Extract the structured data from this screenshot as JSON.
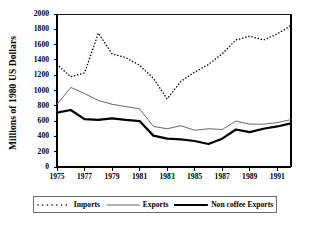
{
  "chart_data": {
    "type": "line",
    "title": "",
    "xlabel": "",
    "ylabel": "Millions of 1980 US Dollars",
    "xlim": [
      1975,
      1992
    ],
    "ylim": [
      0,
      2000
    ],
    "grid": false,
    "legend_position": "bottom",
    "x": [
      1975,
      1976,
      1977,
      1978,
      1979,
      1980,
      1981,
      1982,
      1983,
      1984,
      1985,
      1986,
      1987,
      1988,
      1989,
      1990,
      1991,
      1992
    ],
    "xtick_labels": [
      "1975",
      "1977",
      "1979",
      "1981",
      "1983",
      "1985",
      "1987",
      "1989",
      "1991"
    ],
    "xtick_values": [
      1975,
      1977,
      1979,
      1981,
      1983,
      1985,
      1987,
      1989,
      1991
    ],
    "ytick_labels": [
      "0",
      "200",
      "400",
      "600",
      "800",
      "1000",
      "1200",
      "1400",
      "1600",
      "1800",
      "2000"
    ],
    "ytick_values": [
      0,
      200,
      400,
      600,
      800,
      1000,
      1200,
      1400,
      1600,
      1800,
      2000
    ],
    "series": [
      {
        "name": "Imports",
        "style": "dotted",
        "color": "#000000",
        "values": [
          1340,
          1180,
          1230,
          1750,
          1480,
          1430,
          1330,
          1160,
          890,
          1120,
          1240,
          1340,
          1480,
          1660,
          1710,
          1660,
          1740,
          1850
        ]
      },
      {
        "name": "Exports",
        "style": "thin-solid",
        "color": "#555555",
        "values": [
          820,
          1040,
          960,
          870,
          820,
          790,
          760,
          530,
          500,
          540,
          480,
          500,
          490,
          600,
          560,
          560,
          580,
          620
        ]
      },
      {
        "name": "Non coffee Exports",
        "style": "thick-solid",
        "color": "#000000",
        "values": [
          710,
          745,
          625,
          615,
          635,
          615,
          600,
          410,
          370,
          360,
          340,
          300,
          370,
          490,
          455,
          500,
          530,
          570
        ]
      }
    ]
  },
  "legend": {
    "entries": [
      {
        "label": "Imports",
        "style": "dotted"
      },
      {
        "label": "Exports",
        "style": "thin-solid"
      },
      {
        "label": "Non coffee Exports",
        "style": "thick-solid"
      }
    ]
  },
  "axes": {
    "y_title": "Millions of 1980 US Dollars"
  }
}
